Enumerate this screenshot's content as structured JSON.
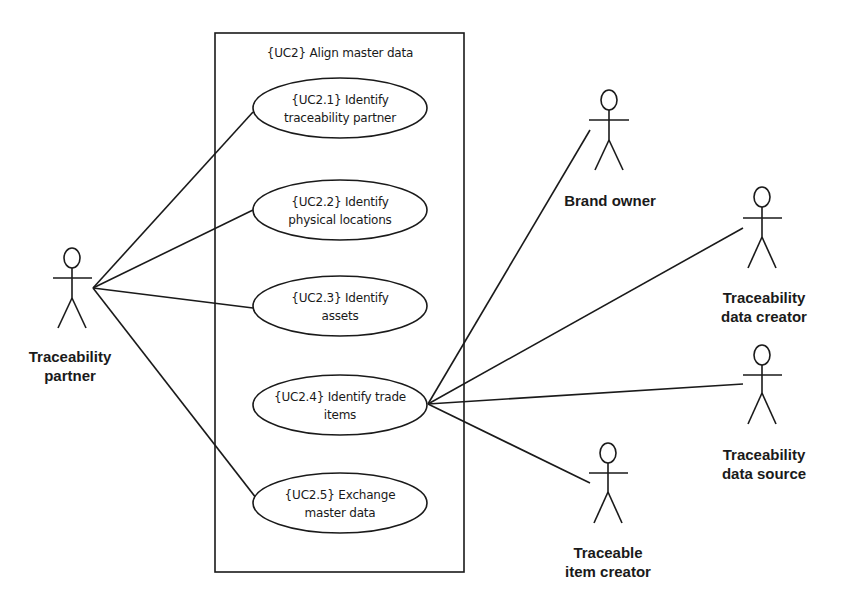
{
  "system": {
    "title": "{UC2} Align master data",
    "box": {
      "x": 215,
      "y": 33,
      "width": 249,
      "height": 539
    }
  },
  "use_cases": [
    {
      "id": "UC2.1",
      "line1": "{UC2.1} Identify",
      "line2": "traceability partner",
      "cx": 340,
      "cy": 108,
      "rx": 87,
      "ry": 30
    },
    {
      "id": "UC2.2",
      "line1": "{UC2.2} Identify",
      "line2": "physical locations",
      "cx": 340,
      "cy": 210,
      "rx": 87,
      "ry": 30
    },
    {
      "id": "UC2.3",
      "line1": "{UC2.3} Identify",
      "line2": "assets",
      "cx": 340,
      "cy": 306,
      "rx": 87,
      "ry": 30
    },
    {
      "id": "UC2.4",
      "line1": "{UC2.4} Identify trade",
      "line2": "items",
      "cx": 340,
      "cy": 405,
      "rx": 87,
      "ry": 30
    },
    {
      "id": "UC2.5",
      "line1": "{UC2.5} Exchange",
      "line2": "master data",
      "cx": 340,
      "cy": 503,
      "rx": 87,
      "ry": 30
    }
  ],
  "actors": [
    {
      "id": "traceability-partner",
      "label1": "Traceability",
      "label2": "partner",
      "x": 72,
      "y": 258,
      "label_x": 72,
      "label_y": 362
    },
    {
      "id": "brand-owner",
      "label1": "Brand owner",
      "label2": "",
      "x": 609,
      "y": 100,
      "label_x": 609,
      "label_y": 206
    },
    {
      "id": "traceability-data-creator",
      "label1": "Traceability",
      "label2": "data creator",
      "x": 762,
      "y": 197,
      "label_x": 765,
      "label_y": 303
    },
    {
      "id": "traceability-data-source",
      "label1": "Traceability",
      "label2": "data source",
      "x": 762,
      "y": 355,
      "label_x": 765,
      "label_y": 460
    },
    {
      "id": "traceable-item-creator",
      "label1": "Traceable",
      "label2": "item creator",
      "x": 608,
      "y": 453,
      "label_x": 608,
      "label_y": 558
    }
  ],
  "associations": [
    {
      "from": "traceability-partner",
      "to": "UC2.1",
      "x1": 93,
      "y1": 288,
      "x2": 253,
      "y2": 112
    },
    {
      "from": "traceability-partner",
      "to": "UC2.2",
      "x1": 93,
      "y1": 288,
      "x2": 253,
      "y2": 210
    },
    {
      "from": "traceability-partner",
      "to": "UC2.3",
      "x1": 93,
      "y1": 288,
      "x2": 253,
      "y2": 308
    },
    {
      "from": "traceability-partner",
      "to": "UC2.5",
      "x1": 93,
      "y1": 288,
      "x2": 253,
      "y2": 503
    },
    {
      "from": "UC2.4",
      "to": "brand-owner",
      "x1": 428,
      "y1": 404,
      "x2": 590,
      "y2": 130
    },
    {
      "from": "UC2.4",
      "to": "traceability-data-creator",
      "x1": 428,
      "y1": 404,
      "x2": 743,
      "y2": 228
    },
    {
      "from": "UC2.4",
      "to": "traceability-data-source",
      "x1": 428,
      "y1": 404,
      "x2": 743,
      "y2": 384
    },
    {
      "from": "UC2.4",
      "to": "traceable-item-creator",
      "x1": 428,
      "y1": 404,
      "x2": 590,
      "y2": 483
    }
  ],
  "colors": {
    "line": "#1a1a1a",
    "background": "#ffffff"
  }
}
